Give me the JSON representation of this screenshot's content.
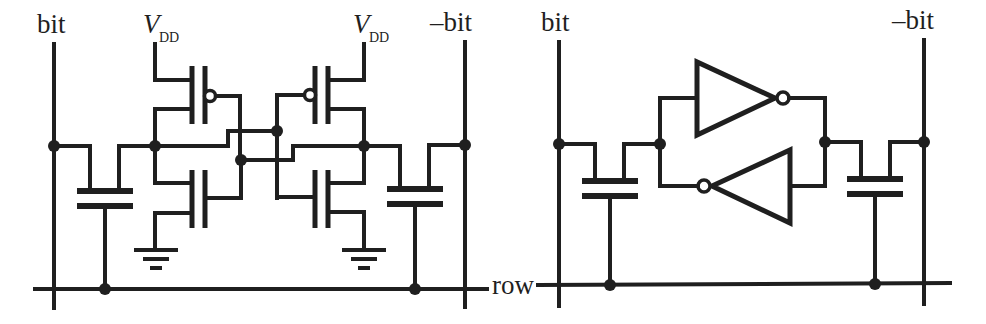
{
  "figure": {
    "colors": {
      "ink": "#1f1f1f",
      "background": "#ffffff"
    }
  },
  "left_circuit": {
    "labels": {
      "bit": "bit",
      "not_bit": "–bit",
      "vdd_left_main": "V",
      "vdd_left_sub": "DD",
      "vdd_right_main": "V",
      "vdd_right_sub": "DD"
    },
    "components": [
      "access-capacitor-left",
      "pmos-left",
      "nmos-left",
      "pmos-right",
      "nmos-right",
      "access-capacitor-right",
      "ground-left",
      "ground-right"
    ]
  },
  "right_circuit": {
    "labels": {
      "bit": "bit",
      "not_bit": "–bit",
      "row": "row"
    },
    "components": [
      "access-capacitor-left",
      "inverter-top",
      "inverter-bottom",
      "access-capacitor-right"
    ]
  },
  "shared": {
    "row_label": "row"
  }
}
